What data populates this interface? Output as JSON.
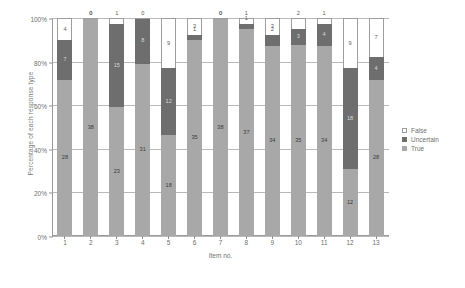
{
  "chart_data": {
    "type": "bar",
    "title": "",
    "subtitle": "",
    "xlabel": "Item no.",
    "ylabel": "Percentage of each response type",
    "stacked": true,
    "normalized_percent": true,
    "grid": true,
    "legend_position": "right",
    "ylim": [
      0,
      100
    ],
    "ytick_labels": [
      "0%",
      "20%",
      "40%",
      "60%",
      "80%",
      "100%"
    ],
    "ytick_values": [
      0,
      20,
      40,
      60,
      80,
      100
    ],
    "categories": [
      "1",
      "2",
      "3",
      "4",
      "5",
      "6",
      "7",
      "8",
      "9",
      "10",
      "11",
      "12",
      "13"
    ],
    "series": [
      {
        "name": "True",
        "color": "#a8a8a8",
        "values": [
          28,
          38,
          23,
          31,
          18,
          35,
          38,
          37,
          34,
          35,
          34,
          12,
          28
        ]
      },
      {
        "name": "Uncertain",
        "color": "#6e6e6e",
        "values": [
          7,
          0,
          15,
          8,
          12,
          1,
          0,
          1,
          2,
          3,
          4,
          18,
          4
        ]
      },
      {
        "name": "False",
        "color": "#ffffff",
        "values": [
          4,
          0,
          1,
          0,
          9,
          3,
          0,
          1,
          3,
          2,
          1,
          9,
          7
        ]
      }
    ]
  },
  "legend": {
    "items": [
      {
        "label": "False",
        "swatch": "sw-false"
      },
      {
        "label": "Uncertain",
        "swatch": "sw-uncertain"
      },
      {
        "label": "True",
        "swatch": "sw-true"
      }
    ]
  },
  "axes": {
    "y_title": "Percentage of each response type",
    "x_title": "Item no."
  },
  "caption": ""
}
